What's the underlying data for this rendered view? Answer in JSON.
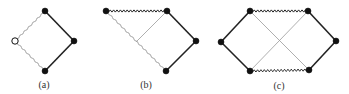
{
  "figure": {
    "width": 349,
    "height": 94,
    "colors": {
      "thick_edge": "#222222",
      "thin_edge": "#9a9a9a",
      "wavy_edge": "#222222",
      "wavy_thin_edge": "#8a8a8a",
      "node_fill": "#111111",
      "open_node_fill": "#ffffff"
    },
    "panels": [
      {
        "id": "a",
        "caption": "(a)",
        "caption_pos": [
          44,
          84
        ],
        "nodes": [
          {
            "id": "top",
            "x": 45,
            "y": 11,
            "type": "filled"
          },
          {
            "id": "left",
            "x": 15,
            "y": 41,
            "type": "open"
          },
          {
            "id": "right",
            "x": 74,
            "y": 41,
            "type": "filled"
          },
          {
            "id": "bottom",
            "x": 45,
            "y": 71,
            "type": "filled"
          }
        ],
        "edges": [
          {
            "from": "top",
            "to": "right",
            "style": "thick"
          },
          {
            "from": "right",
            "to": "bottom",
            "style": "thick"
          },
          {
            "from": "left",
            "to": "top",
            "style": "wavy-thin"
          },
          {
            "from": "left",
            "to": "bottom",
            "style": "wavy-thin"
          }
        ]
      },
      {
        "id": "b",
        "caption": "(b)",
        "caption_pos": [
          146,
          84
        ],
        "nodes": [
          {
            "id": "topleft",
            "x": 106,
            "y": 11,
            "type": "filled"
          },
          {
            "id": "topright",
            "x": 167,
            "y": 11,
            "type": "filled"
          },
          {
            "id": "right",
            "x": 196,
            "y": 41,
            "type": "filled"
          },
          {
            "id": "bottom",
            "x": 166,
            "y": 71,
            "type": "filled"
          }
        ],
        "edges": [
          {
            "from": "topleft",
            "to": "topright",
            "style": "wavy"
          },
          {
            "from": "topright",
            "to": "right",
            "style": "thick"
          },
          {
            "from": "right",
            "to": "bottom",
            "style": "thick"
          },
          {
            "from": "topleft",
            "to": "bottom",
            "style": "wavy-thin"
          },
          {
            "from": "topright",
            "to": "mid",
            "style": "thin"
          }
        ],
        "extra_points": [
          {
            "id": "mid",
            "x": 136,
            "y": 42
          }
        ]
      },
      {
        "id": "c",
        "caption": "(c)",
        "caption_pos": [
          279,
          85
        ],
        "nodes": [
          {
            "id": "left",
            "x": 221,
            "y": 42,
            "type": "filled"
          },
          {
            "id": "topleft",
            "x": 250,
            "y": 11,
            "type": "filled"
          },
          {
            "id": "topright",
            "x": 308,
            "y": 11,
            "type": "filled"
          },
          {
            "id": "right",
            "x": 336,
            "y": 41,
            "type": "filled"
          },
          {
            "id": "bottomright",
            "x": 309,
            "y": 70,
            "type": "filled"
          },
          {
            "id": "bottomleft",
            "x": 250,
            "y": 71,
            "type": "filled"
          }
        ],
        "edges": [
          {
            "from": "left",
            "to": "topleft",
            "style": "thick"
          },
          {
            "from": "left",
            "to": "bottomleft",
            "style": "thick"
          },
          {
            "from": "topright",
            "to": "right",
            "style": "thick"
          },
          {
            "from": "right",
            "to": "bottomright",
            "style": "thick"
          },
          {
            "from": "topleft",
            "to": "topright",
            "style": "wavy"
          },
          {
            "from": "bottomleft",
            "to": "bottomright",
            "style": "wavy"
          },
          {
            "from": "topleft",
            "to": "bottomright",
            "style": "thin"
          },
          {
            "from": "bottomleft",
            "to": "topright",
            "style": "thin"
          }
        ]
      }
    ]
  }
}
